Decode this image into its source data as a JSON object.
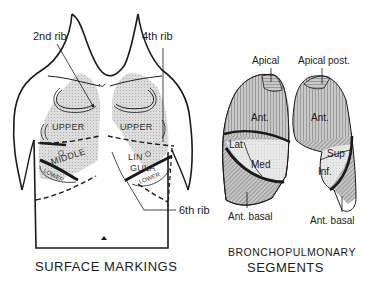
{
  "surface_markings": {
    "caption": "SURFACE MARKINGS",
    "labels": {
      "rib2": "2nd rib",
      "rib4": "4th rib",
      "rib6": "6th rib"
    },
    "lobes": {
      "right_upper": "UPPER",
      "left_upper": "UPPER",
      "right_middle": "MIDDLE",
      "right_lower": "LOWER",
      "lingula_line1": "LIN",
      "lingula_line2": "GULA",
      "left_lower": "LOWER"
    }
  },
  "bronchopulmonary_segments": {
    "caption_line1": "BRONCHOPULMONARY",
    "caption_line2": "SEGMENTS",
    "right_lung": {
      "apical": "Apical",
      "anterior": "Ant.",
      "lateral": "Lat",
      "medial": "Med",
      "anterior_basal": "Ant. basal"
    },
    "left_lung": {
      "apical_posterior": "Apical post.",
      "anterior": "Ant.",
      "superior": "Sup",
      "inferior": "Inf.",
      "anterior_basal": "Ant. basal"
    }
  },
  "colors": {
    "line": "#1a1a1a",
    "lung_fill": "#cfcfcf",
    "lung_fill_light": "#e2e2e2",
    "stripe_fill": "#b8b8b8"
  }
}
